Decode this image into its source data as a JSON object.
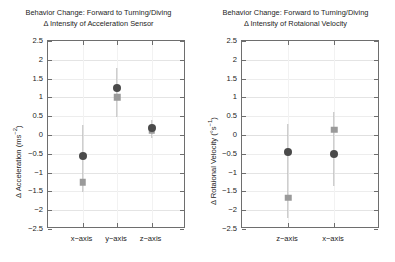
{
  "figure": {
    "background": "#ffffff",
    "circle_color": "#4a4a4a",
    "square_color": "#9a9a9a",
    "errorbar_color": "#b9b9b9",
    "axis_color": "#6e6e6e",
    "grid_color": "#ededed"
  },
  "panels": [
    {
      "id": "acceleration",
      "title": "Behavior Change: Forward to Turning/Diving",
      "subtitle": "Δ Intensity of Acceleration Sensor",
      "ylabel": "Δ Acceleration (ms",
      "ylabel_sup": "−2",
      "ylabel_tail": ")",
      "yticks": [
        "2.5",
        "2",
        "1.5",
        "1",
        "0.5",
        "0",
        "−0.5",
        "−1",
        "−1.5",
        "−2",
        "−2.5"
      ],
      "xticks": [
        "x−axis",
        "y−axis",
        "z−axis"
      ]
    },
    {
      "id": "rotational",
      "title": "Behavior Change: Forward to Turning/Diving",
      "subtitle": "Δ Intensity of Rotaional Velocity",
      "ylabel": "Δ Rotaional Velocity (°s",
      "ylabel_sup": "−1",
      "ylabel_tail": ")",
      "yticks": [
        "2.5",
        "2",
        "1.5",
        "1",
        "0.5",
        "0",
        "−0.5",
        "−1",
        "−1.5",
        "−2",
        "−2.5"
      ],
      "xticks": [
        "z−axis",
        "x−axis"
      ]
    }
  ],
  "chart_data": [
    {
      "type": "scatter",
      "title": "Behavior Change: Forward to Turning/Diving",
      "subtitle": "Δ Intensity of Acceleration Sensor",
      "xlabel": "",
      "ylabel": "Δ Acceleration (ms⁻²)",
      "ylim": [
        -2.5,
        2.5
      ],
      "ytick_values": [
        2.5,
        2,
        1.5,
        1,
        0.5,
        0,
        -0.5,
        -1,
        -1.5,
        -2,
        -2.5
      ],
      "categories": [
        "x−axis",
        "y−axis",
        "z−axis"
      ],
      "grid": true,
      "legend": "none",
      "series": [
        {
          "name": "mean (circle)",
          "marker": "circle",
          "color": "#4a4a4a",
          "values": [
            -0.57,
            1.26,
            0.18
          ],
          "err_low": [
            -1.52,
            0.48,
            -0.08
          ],
          "err_high": [
            0.27,
            1.78,
            0.41
          ]
        },
        {
          "name": "median (square)",
          "marker": "square",
          "color": "#9a9a9a",
          "values": [
            -1.26,
            1.0,
            0.12
          ],
          "err_low": [
            -1.52,
            0.48,
            -0.08
          ],
          "err_high": [
            -1.26,
            1.0,
            0.12
          ]
        }
      ]
    },
    {
      "type": "scatter",
      "title": "Behavior Change: Forward to Turning/Diving",
      "subtitle": "Δ Intensity of Rotaional Velocity",
      "xlabel": "",
      "ylabel": "Δ Rotaional Velocity (°s⁻¹)",
      "ylim": [
        -2.5,
        2.5
      ],
      "ytick_values": [
        2.5,
        2,
        1.5,
        1,
        0.5,
        0,
        -0.5,
        -1,
        -1.5,
        -2,
        -2.5
      ],
      "categories": [
        "z−axis",
        "x−axis"
      ],
      "grid": true,
      "legend": "none",
      "series": [
        {
          "name": "mean (circle)",
          "marker": "circle",
          "color": "#4a4a4a",
          "values": [
            -0.45,
            -0.5
          ],
          "err_low": [
            -2.22,
            -1.35
          ],
          "err_high": [
            0.3,
            0.62
          ]
        },
        {
          "name": "median (square)",
          "marker": "square",
          "color": "#9a9a9a",
          "values": [
            -1.67,
            0.14
          ],
          "err_low": [
            -2.22,
            -1.35
          ],
          "err_high": [
            -1.67,
            0.14
          ]
        }
      ]
    }
  ]
}
